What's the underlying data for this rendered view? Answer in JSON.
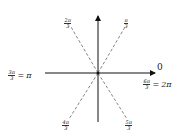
{
  "diagram": {
    "labels": {
      "zero": "0",
      "pi_over_3": {
        "num": "π",
        "den": "3"
      },
      "two_pi_over_3": {
        "num": "2π",
        "den": "3"
      },
      "three_pi_over_3": {
        "num": "3π",
        "den": "3",
        "eq": "=",
        "rhs": "π"
      },
      "four_pi_over_3": {
        "num": "4π",
        "den": "3"
      },
      "five_pi_over_3": {
        "num": "5π",
        "den": "3"
      },
      "six_pi_over_3": {
        "num": "6π",
        "den": "3",
        "eq": "=",
        "rhs": "2π"
      }
    },
    "colors": {
      "axis": "#111111",
      "dashed": "#666666",
      "text": "#222222"
    }
  }
}
